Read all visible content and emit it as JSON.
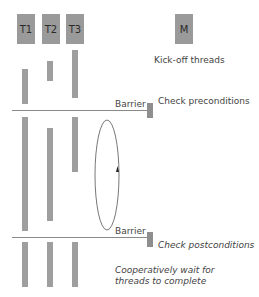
{
  "threads": [
    {
      "label": "T1"
    },
    {
      "label": "T2"
    },
    {
      "label": "T3"
    }
  ],
  "main": {
    "label": "M"
  },
  "annotations": {
    "kickoff": "Kick-off threads",
    "barrier1": "Barrier",
    "preconditions": "Check preconditions",
    "barrier2": "Barrier",
    "postconditions": "Check postconditions",
    "wait_line1": "Cooperatively wait for",
    "wait_line2": "threads to complete"
  },
  "colors": {
    "box": "#9a9a9a",
    "bar": "#9e9e9e",
    "line": "#8a8a8a",
    "text": "#444444"
  }
}
